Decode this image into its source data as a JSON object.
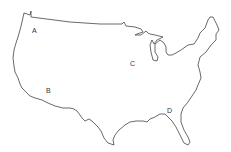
{
  "map": {
    "subject": "Contiguous United States outline",
    "outline_color": "#444444",
    "background": "#ffffff",
    "labels": [
      {
        "text": "A",
        "x": 32,
        "y": 27
      },
      {
        "text": "B",
        "x": 46,
        "y": 87
      },
      {
        "text": "C",
        "x": 130,
        "y": 60
      },
      {
        "text": "D",
        "x": 167,
        "y": 107
      }
    ]
  }
}
